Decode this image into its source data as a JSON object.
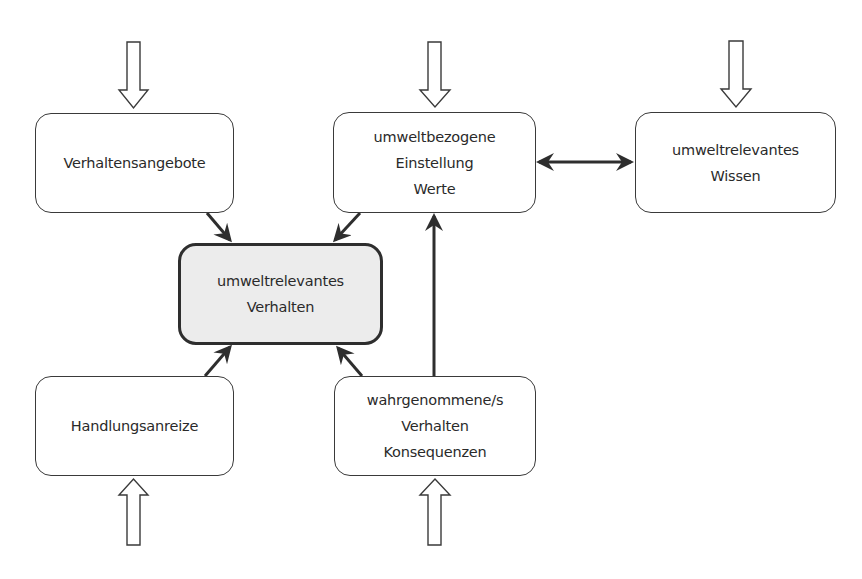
{
  "diagram": {
    "nodes": {
      "verhaltensangebote": {
        "lines": [
          "Verhaltensangebote"
        ]
      },
      "einstellung": {
        "lines": [
          "umweltbezogene",
          "Einstellung",
          "Werte"
        ]
      },
      "wissen": {
        "lines": [
          "umweltrelevantes",
          "Wissen"
        ]
      },
      "verhalten": {
        "lines": [
          "umweltrelevantes",
          "Verhalten"
        ]
      },
      "handlungsanreize": {
        "lines": [
          "Handlungsanreize"
        ]
      },
      "konsequenzen": {
        "lines": [
          "wahrgenommene/s",
          "Verhalten",
          "Konsequenzen"
        ]
      }
    },
    "edges": [
      {
        "from": "verhaltensangebote",
        "to": "verhalten",
        "type": "arrow"
      },
      {
        "from": "einstellung",
        "to": "verhalten",
        "type": "arrow"
      },
      {
        "from": "handlungsanreize",
        "to": "verhalten",
        "type": "arrow"
      },
      {
        "from": "konsequenzen",
        "to": "verhalten",
        "type": "arrow"
      },
      {
        "from": "konsequenzen",
        "to": "einstellung",
        "type": "arrow"
      },
      {
        "from": "einstellung",
        "to": "wissen",
        "type": "bidirectional"
      }
    ],
    "external_inputs": [
      {
        "to": "verhaltensangebote",
        "direction": "down"
      },
      {
        "to": "einstellung",
        "direction": "down"
      },
      {
        "to": "wissen",
        "direction": "down"
      },
      {
        "to": "handlungsanreize",
        "direction": "up"
      },
      {
        "to": "konsequenzen",
        "direction": "up"
      }
    ],
    "colors": {
      "stroke": "#2e2e2e",
      "center_fill": "#ececec"
    }
  }
}
